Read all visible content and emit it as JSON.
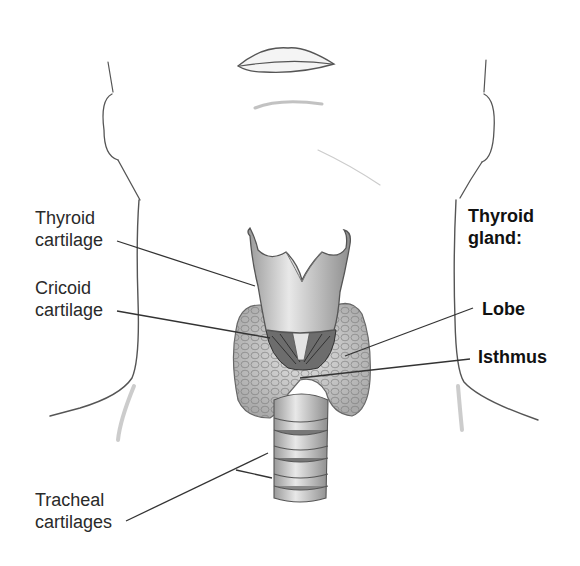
{
  "diagram": {
    "labels_left": [
      {
        "id": "thyroid-cartilage",
        "line1": "Thyroid",
        "line2": "cartilage"
      },
      {
        "id": "cricoid-cartilage",
        "line1": "Cricoid",
        "line2": "cartilage"
      },
      {
        "id": "tracheal-cartilages",
        "line1": "Tracheal",
        "line2": "cartilages"
      }
    ],
    "labels_right": {
      "heading_line1": "Thyroid",
      "heading_line2": "gland:",
      "items": [
        {
          "id": "lobe",
          "text": "Lobe"
        },
        {
          "id": "isthmus",
          "text": "Isthmus"
        }
      ]
    },
    "colors": {
      "background": "#ffffff",
      "line": "#333333",
      "sketch": "#555555",
      "gland_fill": "#c9c9c9",
      "cartilage_fill": "#d6d6d6"
    }
  }
}
